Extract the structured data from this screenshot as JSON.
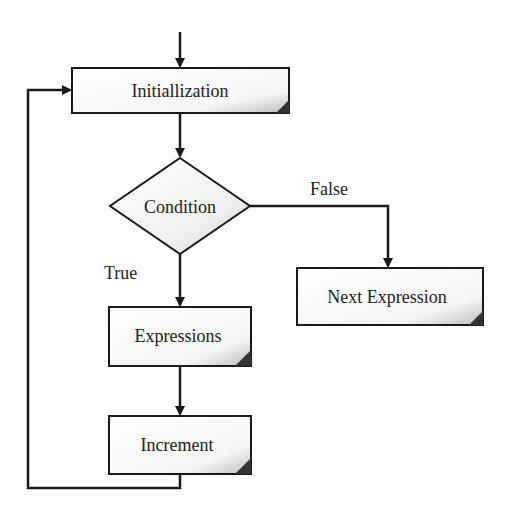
{
  "diagram": {
    "type": "flowchart",
    "nodes": [
      {
        "id": "init",
        "shape": "process",
        "label": "Initiallization"
      },
      {
        "id": "cond",
        "shape": "decision",
        "label": "Condition"
      },
      {
        "id": "expr",
        "shape": "process",
        "label": "Expressions"
      },
      {
        "id": "incr",
        "shape": "process",
        "label": "Increment"
      },
      {
        "id": "next",
        "shape": "process",
        "label": "Next Expression"
      }
    ],
    "edges": [
      {
        "from": "start",
        "to": "init",
        "label": ""
      },
      {
        "from": "init",
        "to": "cond",
        "label": ""
      },
      {
        "from": "cond",
        "to": "expr",
        "label": "True"
      },
      {
        "from": "cond",
        "to": "next",
        "label": "False"
      },
      {
        "from": "expr",
        "to": "incr",
        "label": ""
      },
      {
        "from": "incr",
        "to": "init",
        "label": ""
      }
    ],
    "edge_labels": {
      "true": "True",
      "false": "False"
    },
    "colors": {
      "line": "#1a1a1a",
      "box_fill": "#ffffff",
      "shade": "#c8c8c8",
      "corner": "#333333"
    }
  }
}
